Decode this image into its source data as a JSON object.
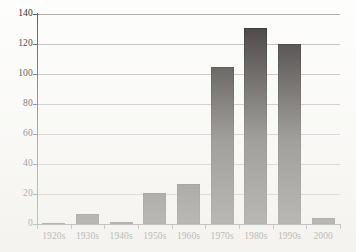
{
  "chart_data": {
    "type": "bar",
    "title": "",
    "subtitle": "",
    "xlabel": "",
    "ylabel": "",
    "categories": [
      "1920s",
      "1930s",
      "1940s",
      "1950s",
      "1960s",
      "1970s",
      "1980s",
      "1990s",
      "2000"
    ],
    "values": [
      1,
      7,
      1.5,
      21,
      26.5,
      105,
      131,
      120,
      4
    ],
    "ylim": [
      0,
      140
    ],
    "yticks": [
      0,
      20,
      40,
      60,
      80,
      100,
      120,
      140
    ],
    "ytick_labels": [
      "0",
      "20",
      "40",
      "60",
      "80",
      "100",
      "120",
      "140"
    ],
    "grid": true,
    "grid_axis": "y",
    "legend": false,
    "legend_position": "none",
    "bar_color": "#3a3635",
    "gridline_color": "#b9b9b6",
    "axis_color": "#58585a",
    "background_color": "#fdfdfc",
    "text_color": "#262626"
  }
}
